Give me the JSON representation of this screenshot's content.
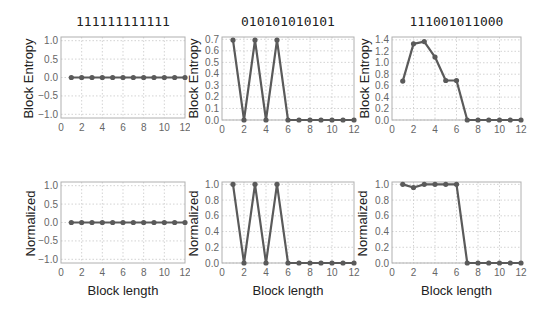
{
  "chart_data": [
    {
      "id": "p1",
      "type": "line",
      "title": "111111111111",
      "xlabel": "",
      "ylabel": "Block Entropy",
      "xlim": [
        0,
        12
      ],
      "ylim": [
        -1.1,
        1.1
      ],
      "xticks": [
        0,
        2,
        4,
        6,
        8,
        10,
        12
      ],
      "yticks": [
        -1.0,
        -0.5,
        0.0,
        0.5,
        1.0
      ],
      "ytick_labels": [
        "−1.0",
        "−0.5",
        "0.0",
        "0.5",
        "1.0"
      ],
      "grid": true,
      "x": [
        1,
        2,
        3,
        4,
        5,
        6,
        7,
        8,
        9,
        10,
        11,
        12
      ],
      "values": [
        0,
        0,
        0,
        0,
        0,
        0,
        0,
        0,
        0,
        0,
        0,
        0
      ]
    },
    {
      "id": "p2",
      "type": "line",
      "title": "010101010101",
      "xlabel": "",
      "ylabel": "Block Entropy",
      "xlim": [
        0,
        12
      ],
      "ylim": [
        0,
        0.72
      ],
      "xticks": [
        0,
        2,
        4,
        6,
        8,
        10,
        12
      ],
      "yticks": [
        0.0,
        0.1,
        0.2,
        0.3,
        0.4,
        0.5,
        0.6,
        0.7
      ],
      "ytick_labels": [
        "0.0",
        "0.1",
        "0.2",
        "0.3",
        "0.4",
        "0.5",
        "0.6",
        "0.7"
      ],
      "grid": true,
      "x": [
        1,
        2,
        3,
        4,
        5,
        6,
        7,
        8,
        9,
        10,
        11,
        12
      ],
      "values": [
        0.693,
        0,
        0.693,
        0,
        0.693,
        0,
        0,
        0,
        0,
        0,
        0,
        0
      ]
    },
    {
      "id": "p3",
      "type": "line",
      "title": "111001011000",
      "xlabel": "",
      "ylabel": "Block Entropy",
      "xlim": [
        0,
        12
      ],
      "ylim": [
        0,
        1.45
      ],
      "xticks": [
        0,
        2,
        4,
        6,
        8,
        10,
        12
      ],
      "yticks": [
        0.0,
        0.2,
        0.4,
        0.6,
        0.8,
        1.0,
        1.2,
        1.4
      ],
      "ytick_labels": [
        "0.0",
        "0.2",
        "0.4",
        "0.6",
        "0.8",
        "1.0",
        "1.2",
        "1.4"
      ],
      "grid": true,
      "x": [
        1,
        2,
        3,
        4,
        5,
        6,
        7,
        8,
        9,
        10,
        11,
        12
      ],
      "values": [
        0.68,
        1.33,
        1.37,
        1.1,
        0.69,
        0.69,
        0,
        0,
        0,
        0,
        0,
        0
      ]
    },
    {
      "id": "p4",
      "type": "line",
      "title": "",
      "xlabel": "Block length",
      "ylabel": "Normalized",
      "xlim": [
        0,
        12
      ],
      "ylim": [
        -1.1,
        1.1
      ],
      "xticks": [
        0,
        2,
        4,
        6,
        8,
        10,
        12
      ],
      "yticks": [
        -1.0,
        -0.5,
        0.0,
        0.5,
        1.0
      ],
      "ytick_labels": [
        "−1.0",
        "−0.5",
        "0.0",
        "0.5",
        "1.0"
      ],
      "grid": true,
      "x": [
        1,
        2,
        3,
        4,
        5,
        6,
        7,
        8,
        9,
        10,
        11,
        12
      ],
      "values": [
        0,
        0,
        0,
        0,
        0,
        0,
        0,
        0,
        0,
        0,
        0,
        0
      ]
    },
    {
      "id": "p5",
      "type": "line",
      "title": "",
      "xlabel": "Block length",
      "ylabel": "Normalized",
      "xlim": [
        0,
        12
      ],
      "ylim": [
        0,
        1.03
      ],
      "xticks": [
        0,
        2,
        4,
        6,
        8,
        10,
        12
      ],
      "yticks": [
        0.0,
        0.2,
        0.4,
        0.6,
        0.8,
        1.0
      ],
      "ytick_labels": [
        "0.0",
        "0.2",
        "0.4",
        "0.6",
        "0.8",
        "1.0"
      ],
      "grid": true,
      "x": [
        1,
        2,
        3,
        4,
        5,
        6,
        7,
        8,
        9,
        10,
        11,
        12
      ],
      "values": [
        1,
        0,
        1,
        0,
        1,
        0,
        0,
        0,
        0,
        0,
        0,
        0
      ]
    },
    {
      "id": "p6",
      "type": "line",
      "title": "",
      "xlabel": "Block length",
      "ylabel": "Normalized",
      "xlim": [
        0,
        12
      ],
      "ylim": [
        0,
        1.03
      ],
      "xticks": [
        0,
        2,
        4,
        6,
        8,
        10,
        12
      ],
      "yticks": [
        0.0,
        0.2,
        0.4,
        0.6,
        0.8,
        1.0
      ],
      "ytick_labels": [
        "0.0",
        "0.2",
        "0.4",
        "0.6",
        "0.8",
        "1.0"
      ],
      "grid": true,
      "x": [
        1,
        2,
        3,
        4,
        5,
        6,
        7,
        8,
        9,
        10,
        11,
        12
      ],
      "values": [
        1.0,
        0.96,
        1.0,
        1.0,
        1.0,
        1.0,
        0,
        0,
        0,
        0,
        0,
        0
      ]
    }
  ],
  "style": {
    "line_color": "#5a5a5a",
    "frame_color": "#b0b0b0",
    "grid_color": "#c8c8c8",
    "tick_label_color": "#666666"
  }
}
